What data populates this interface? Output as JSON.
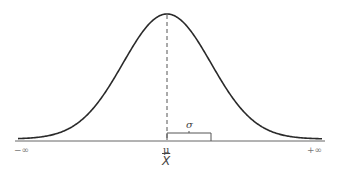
{
  "diagram": {
    "type": "normal-distribution-bell-curve",
    "colors": {
      "curve": "#2a2a2a",
      "axis": "#555555",
      "mean_line": "#555555",
      "bracket": "#555555",
      "background": "#ffffff"
    },
    "labels": {
      "left_infinity": "−∞",
      "right_infinity": "+∞",
      "mean_symbol": "μ",
      "sample_mean_symbol": "X",
      "std_dev_symbol": "σ"
    }
  },
  "chart_data": {
    "type": "line",
    "title": "",
    "xlabel": "",
    "ylabel": "",
    "x_tick_labels": [
      "−∞",
      "μ / X̄",
      "+∞"
    ],
    "annotations": [
      {
        "text": "σ",
        "meaning": "one standard deviation from the mean"
      },
      {
        "text": "μ",
        "position": "mean"
      },
      {
        "text": "X̄",
        "position": "mean"
      }
    ],
    "series": [
      {
        "name": "normal-pdf",
        "mean": 0,
        "std": 1,
        "x_range_sd": [
          -3.4,
          3.4
        ]
      }
    ],
    "grid": false,
    "legend": null
  }
}
